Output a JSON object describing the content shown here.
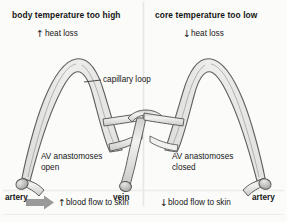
{
  "figure": {
    "name": "skin-blood-flow-thermoregulation-diagram",
    "background_color": "#fbfbf9",
    "divider_color": "#e3e3e0",
    "vessel_fill": "#e6e6e4",
    "vessel_fill_light": "#ededeb",
    "vessel_outline": "#5a5a5a",
    "arrow_gray": "#8f8f8f",
    "text_color": "#161616"
  },
  "panels": [
    {
      "id": "left",
      "title": "body temperature too high",
      "subtitle_arrow": "↑",
      "subtitle": "heat loss",
      "anastomoses_label": "AV anastomoses\nopen",
      "flow_arrow": "↑",
      "flow_label": "blood flow to skin",
      "has_bulk_arrow": true,
      "vessel_end_label": "artery",
      "callout_label": "capillary loop"
    },
    {
      "id": "right",
      "title": "core temperature too low",
      "subtitle_arrow": "↓",
      "subtitle": "heat loss",
      "anastomoses_label": "AV anastomoses\nclosed",
      "flow_arrow": "↓",
      "flow_label": "blood flow to skin",
      "has_bulk_arrow": false,
      "vessel_end_label": "artery",
      "callout_label": ""
    }
  ],
  "shared": {
    "vein_label": "vein"
  }
}
